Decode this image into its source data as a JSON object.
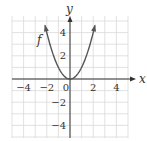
{
  "chart_data": {
    "type": "line",
    "title": "",
    "function_label": "f",
    "equation": "y = x^2",
    "xlabel": "x",
    "ylabel": "y",
    "xlim": [
      -5,
      5
    ],
    "ylim": [
      -5,
      5
    ],
    "grid": true,
    "grid_step": 1,
    "x_ticks": [
      -4,
      -2,
      0,
      2,
      4
    ],
    "y_ticks": [
      -4,
      -2,
      2,
      4
    ],
    "x_tick_labels": [
      "−4",
      "−2",
      "0",
      "2",
      "4"
    ],
    "y_tick_labels": [
      "−4",
      "−2",
      "2",
      "4"
    ],
    "series": [
      {
        "name": "f",
        "x": [
          -2.2,
          -2,
          -1.5,
          -1,
          -0.5,
          0,
          0.5,
          1,
          1.5,
          2,
          2.2
        ],
        "y": [
          4.84,
          4,
          2.25,
          1,
          0.25,
          0,
          0.25,
          1,
          2.25,
          4,
          4.84
        ]
      }
    ],
    "colors": {
      "curve": "#555555",
      "axis": "#333333",
      "grid": "#d9d9d9"
    }
  }
}
